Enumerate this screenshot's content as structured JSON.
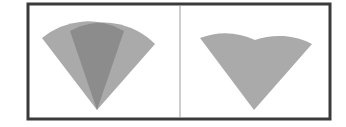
{
  "diagram": {
    "panels": [
      {
        "name": "overlapping-sectors",
        "description": "Two overlapping circular sectors, intersection shown darker"
      },
      {
        "name": "union-shape",
        "description": "Union of two circular sectors filled uniformly"
      }
    ],
    "colors": {
      "frame": "#3a3a3a",
      "divider": "#9a9a9a",
      "sector_fill": "#a8a8a8",
      "overlap_fill": "#8a8a8a",
      "background": "#ffffff"
    }
  }
}
